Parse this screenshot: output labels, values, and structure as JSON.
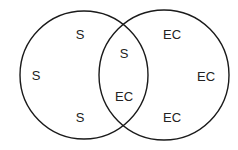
{
  "diagram": {
    "type": "venn",
    "stroke_color": "#1a1a1a",
    "text_color": "#222222",
    "circles": [
      {
        "name": "left",
        "cx": 84,
        "cy": 75,
        "r": 64
      },
      {
        "name": "right",
        "cx": 164,
        "cy": 75,
        "r": 65
      }
    ],
    "labels": [
      {
        "region": "left-only",
        "text": "S",
        "x": 80,
        "y": 34
      },
      {
        "region": "left-only",
        "text": "S",
        "x": 36,
        "y": 75
      },
      {
        "region": "left-only",
        "text": "S",
        "x": 80,
        "y": 117
      },
      {
        "region": "intersection",
        "text": "S",
        "x": 124,
        "y": 53
      },
      {
        "region": "intersection",
        "text": "EC",
        "x": 124,
        "y": 96
      },
      {
        "region": "right-only",
        "text": "EC",
        "x": 172,
        "y": 34
      },
      {
        "region": "right-only",
        "text": "EC",
        "x": 206,
        "y": 76
      },
      {
        "region": "right-only",
        "text": "EC",
        "x": 172,
        "y": 117
      }
    ]
  }
}
